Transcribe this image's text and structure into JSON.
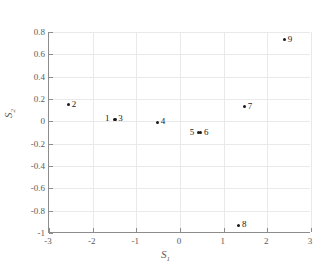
{
  "chart_data": {
    "type": "scatter",
    "title": "",
    "xlabel": "S1",
    "ylabel": "S2",
    "xlabel_base": "S",
    "xlabel_sub": "1",
    "ylabel_base": "S",
    "ylabel_sub": "2",
    "xlim": [
      -3,
      3
    ],
    "ylim": [
      -1,
      0.8
    ],
    "xticks": [
      -3,
      -2,
      -1,
      0,
      1,
      2,
      3
    ],
    "yticks": [
      -1,
      -0.8,
      -0.6,
      -0.4,
      -0.2,
      0,
      0.2,
      0.4,
      0.6,
      0.8
    ],
    "xticklabels": [
      "-3",
      "-2",
      "-1",
      "0",
      "1",
      "2",
      "3"
    ],
    "yticklabels": [
      "-1",
      "-0.8",
      "-0.6",
      "-0.4",
      "-0.2",
      "0",
      "0.2",
      "0.4",
      "0.6",
      "0.8"
    ],
    "grid": true,
    "legend": "none",
    "marker_color": "#1a1a1a",
    "axis_color": "#8c8c8c",
    "grid_color": "#e9e9e9",
    "points": [
      {
        "label": "1",
        "x": -1.51,
        "y": 0.02,
        "label_side": "left"
      },
      {
        "label": "2",
        "x": -2.55,
        "y": 0.15,
        "label_side": "right"
      },
      {
        "label": "3",
        "x": -1.48,
        "y": 0.02,
        "label_side": "right"
      },
      {
        "label": "4",
        "x": -0.51,
        "y": -0.01,
        "label_side": "right"
      },
      {
        "label": "5",
        "x": 0.43,
        "y": -0.1,
        "label_side": "left"
      },
      {
        "label": "6",
        "x": 0.48,
        "y": -0.1,
        "label_side": "right"
      },
      {
        "label": "7",
        "x": 1.48,
        "y": 0.13,
        "label_side": "right"
      },
      {
        "label": "8",
        "x": 1.35,
        "y": -0.93,
        "label_side": "right"
      },
      {
        "label": "9",
        "x": 2.4,
        "y": 0.73,
        "label_side": "right"
      }
    ]
  }
}
